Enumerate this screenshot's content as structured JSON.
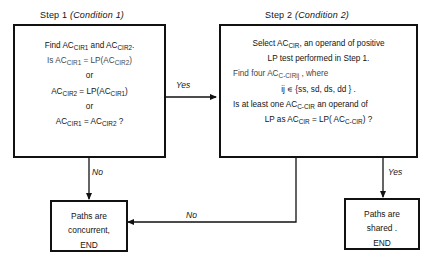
{
  "diagram": {
    "title_step1": "Step 1",
    "title_step1_cond": "(Condition 1)",
    "title_step2": "Step 2",
    "title_step2_cond": "(Condition 2)",
    "step1": {
      "line1_a": "Find AC",
      "line1_sub1": "CIR1",
      "line1_b": " and AC",
      "line1_sub2": "CIR2",
      "line1_c": ".",
      "line2_a": "Is AC",
      "line2_sub1": "CIR1",
      "line2_b": " = LP(AC",
      "line2_sub2": "CIR2",
      "line2_c": ")",
      "or_1": "or",
      "line3_a": "AC",
      "line3_sub1": "CIR2",
      "line3_b": " = LP(AC",
      "line3_sub2": "CIR1",
      "line3_c": ")",
      "or_2": "or",
      "line4_a": "AC",
      "line4_sub1": "CIR1",
      "line4_b": " = AC",
      "line4_sub2": "CIR2",
      "line4_c": " ?"
    },
    "step2": {
      "line1_a": "Select AC",
      "line1_sub1": "CIR",
      "line1_b": ", an operand of positive",
      "line2": "LP test performed in Step 1.",
      "line3_a": "Find four AC",
      "line3_sub1": "C-CIR",
      "line3_sub2": "ij",
      "line3_b": " , where",
      "line4_a": "ij ∊ {ss, sd, ds, dd } .",
      "line5_a": "Is at least one AC",
      "line5_sub1": "C-CIR",
      "line5_b": " an operand of",
      "line6_a": "LP as AC",
      "line6_sub1": "CIR",
      "line6_b": " = LP( AC",
      "line6_sub2": "C-CIR",
      "line6_c": ") ?"
    },
    "terminal_left": {
      "line1": "Paths are",
      "line2": "concurrent,",
      "line3": "END"
    },
    "terminal_right": {
      "line1": "Paths are",
      "line2": "shared .",
      "line3": "END"
    },
    "edges": {
      "step1_to_step2": "Yes",
      "step1_to_concurrent": "No",
      "step2_to_concurrent": "No",
      "step2_to_shared": "Yes"
    },
    "colors": {
      "stroke": "#111111",
      "text": "#141414",
      "background": "#ffffff"
    }
  }
}
